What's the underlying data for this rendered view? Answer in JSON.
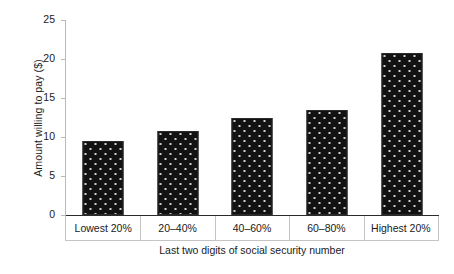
{
  "chart_data": {
    "type": "bar",
    "title": "",
    "xlabel": "Last two digits of social security number",
    "ylabel": "Amount willing to pay ($)",
    "categories": [
      "Lowest 20%",
      "20–40%",
      "40–60%",
      "60–80%",
      "Highest 20%"
    ],
    "values": [
      9.5,
      10.8,
      12.5,
      13.4,
      20.8
    ],
    "ylim": [
      0,
      25
    ],
    "yticks": [
      0,
      5,
      10,
      15,
      20,
      25
    ],
    "ytick_labels": [
      "0",
      "5",
      "10",
      "15",
      "20",
      "25"
    ],
    "grid": false,
    "legend": null,
    "series": [
      {
        "name": "Amount willing to pay",
        "values": [
          9.5,
          10.8,
          12.5,
          13.4,
          20.8
        ]
      }
    ],
    "bar_color": "#121212",
    "bar_pattern": "dotted"
  }
}
